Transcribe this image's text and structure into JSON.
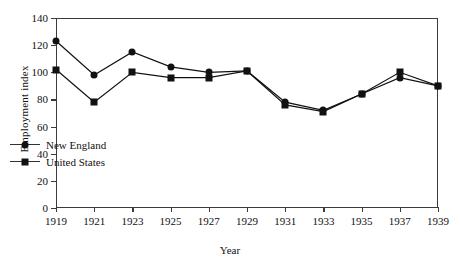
{
  "chart_data": {
    "type": "line",
    "title": "",
    "xlabel": "Year",
    "ylabel": "Employment index",
    "x": [
      1919,
      1921,
      1923,
      1925,
      1927,
      1929,
      1931,
      1933,
      1935,
      1937,
      1939
    ],
    "xtick_labels": [
      "1919",
      "1921",
      "1923",
      "1925",
      "1927",
      "1929",
      "1931",
      "1933",
      "1935",
      "1937",
      "1939"
    ],
    "ytick_labels": [
      "0",
      "20",
      "40",
      "60",
      "80",
      "100",
      "120",
      "140"
    ],
    "ytick_values": [
      0,
      20,
      40,
      60,
      80,
      100,
      120,
      140
    ],
    "xlim": [
      1919,
      1939
    ],
    "ylim": [
      0,
      140
    ],
    "grid": false,
    "legend_position": "lower left",
    "series": [
      {
        "name": "New England",
        "marker": "circle",
        "color": "#111111",
        "values": [
          123,
          98,
          115,
          104,
          100,
          101,
          78,
          72,
          84,
          96,
          90
        ]
      },
      {
        "name": "United States",
        "marker": "square",
        "color": "#111111",
        "values": [
          102,
          78,
          100,
          96,
          96,
          101,
          76,
          71,
          84,
          100,
          90
        ]
      }
    ]
  }
}
